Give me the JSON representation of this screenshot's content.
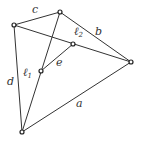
{
  "diagram": {
    "type": "graph",
    "nodes": [
      {
        "id": "v1",
        "x": 14,
        "y": 25
      },
      {
        "id": "v2",
        "x": 60,
        "y": 12
      },
      {
        "id": "l2",
        "x": 73,
        "y": 44
      },
      {
        "id": "v3",
        "x": 131,
        "y": 62
      },
      {
        "id": "l1",
        "x": 41,
        "y": 71
      },
      {
        "id": "v4",
        "x": 22,
        "y": 132
      }
    ],
    "edges": [
      {
        "from": "v1",
        "to": "v2",
        "label": "c"
      },
      {
        "from": "v2",
        "to": "v3",
        "label": "b"
      },
      {
        "from": "v1",
        "to": "v3",
        "label": ""
      },
      {
        "from": "v2",
        "to": "v4",
        "label": ""
      },
      {
        "from": "l1",
        "to": "l2",
        "label": "e"
      },
      {
        "from": "v1",
        "to": "v4",
        "label": "d"
      },
      {
        "from": "v4",
        "to": "v3",
        "label": "a"
      }
    ],
    "labels": {
      "c": "c",
      "b": "b",
      "e": "e",
      "d": "d",
      "a": "a",
      "l1_base": "ℓ",
      "l1_sub": "1",
      "l2_base": "ℓ",
      "l2_sub": "2"
    }
  }
}
